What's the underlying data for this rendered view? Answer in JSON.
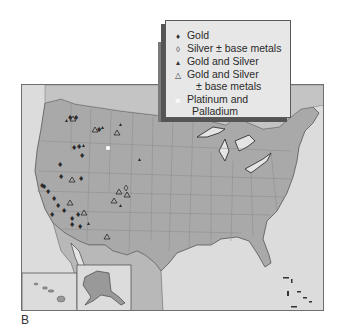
{
  "figure": {
    "panel_label": "B",
    "type": "map",
    "region": "United States",
    "insets": [
      "Hawaii",
      "Alaska"
    ]
  },
  "legend": {
    "items": [
      {
        "symbol": "filled-diamond",
        "glyph": "♦",
        "label": "Gold"
      },
      {
        "symbol": "open-diamond",
        "glyph": "◊",
        "label": "Silver ± base metals"
      },
      {
        "symbol": "small-filled-triangle",
        "glyph": "▴",
        "label": "Gold and Silver"
      },
      {
        "symbol": "open-triangle",
        "glyph": "△",
        "label": "Gold and Silver",
        "label2": "± base metals"
      },
      {
        "symbol": "white-square",
        "glyph": "■",
        "label": "Platinum and",
        "label2": "Palladium"
      }
    ]
  },
  "colors": {
    "land": "#a8a8a8",
    "water": "#dcdcdc",
    "legend_bg": "#e7e7e7",
    "symbol": "#2a2a2a",
    "platinum": "#ffffff"
  }
}
